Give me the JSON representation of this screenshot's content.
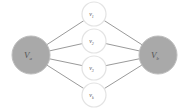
{
  "diagram": {
    "type": "bipartite-graph",
    "source": {
      "id": "Va",
      "label": "V",
      "sub": "a",
      "cx": 31,
      "cy": 55,
      "r": 19,
      "fill": "#a9a9a9"
    },
    "sink": {
      "id": "Vb",
      "label": "V",
      "sub": "b",
      "cx": 158,
      "cy": 55,
      "r": 19,
      "fill": "#a9a9a9"
    },
    "middle": [
      {
        "id": "v1",
        "label": "v",
        "sub": "1",
        "cx": 94,
        "cy": 14,
        "r": 12
      },
      {
        "id": "v2",
        "label": "v",
        "sub": "2",
        "cx": 94,
        "cy": 41,
        "r": 12
      },
      {
        "id": "v3",
        "label": "v",
        "sub": "3",
        "cx": 94,
        "cy": 68,
        "r": 12
      },
      {
        "id": "vk",
        "label": "v",
        "sub": "k",
        "cx": 94,
        "cy": 95,
        "r": 12
      }
    ],
    "edges": [
      [
        "Va",
        "v1"
      ],
      [
        "Va",
        "v2"
      ],
      [
        "Va",
        "v3"
      ],
      [
        "Va",
        "vk"
      ],
      [
        "v1",
        "Vb"
      ],
      [
        "v2",
        "Vb"
      ],
      [
        "v3",
        "Vb"
      ],
      [
        "vk",
        "Vb"
      ]
    ]
  }
}
